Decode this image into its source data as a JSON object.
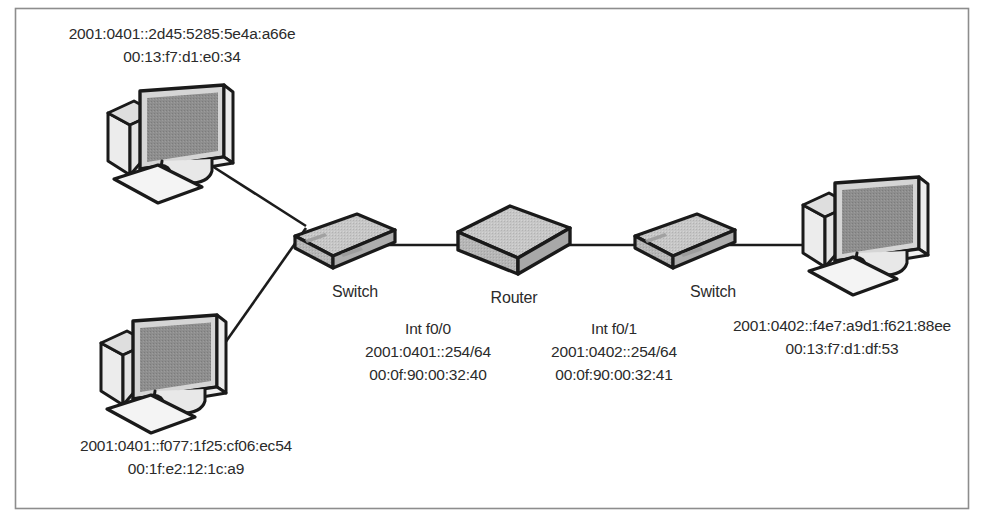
{
  "figure": {
    "kind": "network-topology-diagram",
    "background_color": "#ffffff",
    "border_color": "#8d8d8d",
    "line_color": "#1c1c1c",
    "text_color": "#2b2b2b"
  },
  "nodes": {
    "pc_top_left": {
      "icon": "desktop-computer-icon",
      "ipv6": "2001:0401::2d45:5285:5e4a:a66e",
      "mac": "00:13:f7:d1:e0:34"
    },
    "pc_bottom_left": {
      "icon": "desktop-computer-icon",
      "ipv6": "2001:0401::f077:1f25:cf06:ec54",
      "mac": "00:1f:e2:12:1c:a9"
    },
    "pc_right": {
      "icon": "desktop-computer-icon",
      "ipv6": "2001:0402::f4e7:a9d1:f621:88ee",
      "mac": "00:13:f7:d1:df:53"
    },
    "switch_left": {
      "icon": "network-switch-icon",
      "label": "Switch"
    },
    "switch_right": {
      "icon": "network-switch-icon",
      "label": "Switch"
    },
    "router": {
      "icon": "router-icon",
      "label": "Router"
    }
  },
  "router_interfaces": [
    {
      "name": "Int f0/0",
      "ipv6": "2001:0401::254/64",
      "mac": "00:0f:90:00:32:40"
    },
    {
      "name": "Int f0/1",
      "ipv6": "2001:0402::254/64",
      "mac": "00:0f:90:00:32:41"
    }
  ],
  "links": [
    {
      "from": "pc_top_left",
      "to": "switch_left"
    },
    {
      "from": "pc_bottom_left",
      "to": "switch_left"
    },
    {
      "from": "switch_left",
      "to": "router"
    },
    {
      "from": "router",
      "to": "switch_right"
    },
    {
      "from": "switch_right",
      "to": "pc_right"
    }
  ],
  "palette": {
    "screen_dark": "#8a8a8a",
    "screen_mid": "#9a9a9a",
    "body_light": "#f2f2f2",
    "body_mid": "#d8d8d8",
    "device_top": "#c9c9c9",
    "device_front": "#b4b4b4",
    "device_side": "#a0a0a0"
  }
}
